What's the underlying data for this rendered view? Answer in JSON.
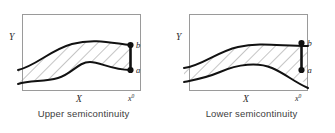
{
  "figure": {
    "width": 335,
    "height": 133,
    "background_color": "#ffffff"
  },
  "panels": [
    {
      "id": "upper",
      "caption": "Upper semicontinuity",
      "axis": {
        "y_label": "Y",
        "x_label": "X",
        "x0_base": "x",
        "x0_sup": "0"
      },
      "points": [
        {
          "name": "b",
          "label": "b",
          "role": "upper-endpoint",
          "marker": "filled-dot"
        },
        {
          "name": "a",
          "label": "a",
          "role": "lower-endpoint",
          "marker": "filled-dot"
        }
      ],
      "segment": {
        "present": true,
        "description": "closed vertical segment joining a and b at x0",
        "style": "solid-thick"
      },
      "region": {
        "fill": "hatched",
        "hatch_color": "#8c8c8c",
        "boundary_color": "#111111",
        "description": "band between upper and lower curves, closed at x0"
      }
    },
    {
      "id": "lower",
      "caption": "Lower semicontinuity",
      "axis": {
        "y_label": "Y",
        "x_label": "X",
        "x0_base": "x",
        "x0_sup": "0"
      },
      "points": [
        {
          "name": "b",
          "label": "b",
          "role": "upper-endpoint",
          "marker": "filled-dot"
        },
        {
          "name": "a",
          "label": "a",
          "role": "lower-endpoint",
          "marker": "filled-dot"
        }
      ],
      "segment": {
        "present": true,
        "description": "isolated vertical segment from a to b located at x0 boundary",
        "style": "solid-thick"
      },
      "region": {
        "fill": "hatched",
        "hatch_color": "#8c8c8c",
        "boundary_color": "#111111",
        "description": "band between upper and lower curves that pinches toward x0"
      }
    }
  ],
  "colors": {
    "frame": "#9a9a9a",
    "curve": "#111111",
    "hatch": "#8c8c8c",
    "caption_text": "#3d3d3d",
    "label_text": "#2b2b2b",
    "marker": "#111111"
  }
}
